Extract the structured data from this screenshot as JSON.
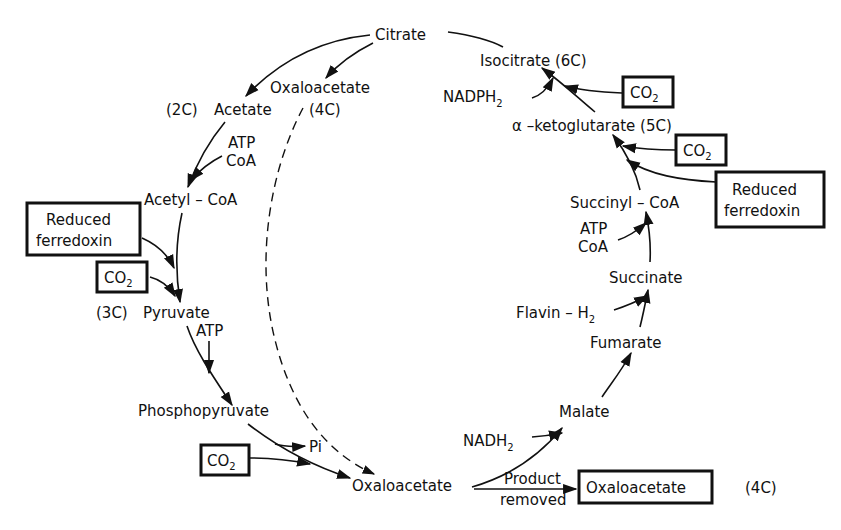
{
  "compounds": {
    "citrate": "Citrate",
    "isocitrate": "Isocitrate (6C)",
    "alpha_ketoglutarate": "α –ketoglutarate (5C)",
    "succinyl_coa": "Succinyl – CoA",
    "succinate": "Succinate",
    "fumarate": "Fumarate",
    "malate": "Malate",
    "oxaloacetate_bottom": "Oxaloacetate",
    "phosphopyruvate": "Phosphopyruvate",
    "pyruvate": "Pyruvate",
    "pyruvate_carbon": "(3C)",
    "acetyl_coa": "Acetyl – CoA",
    "acetate": "Acetate",
    "acetate_carbon": "(2C)",
    "oxaloacetate_top": "Oxaloacetate",
    "oxaloacetate_top_carbon": "(4C)"
  },
  "cofactors": {
    "nadph2": "NADPH",
    "nadph2_sub": "2",
    "atp_coa_left_1": "ATP",
    "atp_coa_left_2": "CoA",
    "atp_coa_right_1": "ATP",
    "atp_coa_right_2": "CoA",
    "atp_pyruvate": "ATP",
    "flavin_h2": "Flavin – H",
    "flavin_h2_sub": "2",
    "nadh2": "NADH",
    "nadh2_sub": "2",
    "pi": "Pi"
  },
  "boxes": {
    "co2_isocitrate": "CO",
    "co2_akg": "CO",
    "co2_pyruvate": "CO",
    "co2_oxaloacetate": "CO",
    "co2_sub": "2",
    "reduced_ferredoxin_right_1": "Reduced",
    "reduced_ferredoxin_right_2": "ferredoxin",
    "reduced_ferredoxin_left_1": "Reduced",
    "reduced_ferredoxin_left_2": "ferredoxin",
    "oxaloacetate_product": "Oxaloacetate",
    "oxaloacetate_product_carbon": "(4C)"
  },
  "product_arrow": {
    "line1": "Product",
    "line2": "removed"
  }
}
